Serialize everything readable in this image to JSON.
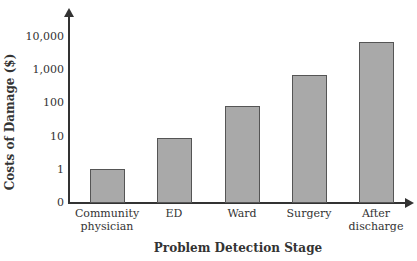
{
  "chart_data": {
    "type": "bar",
    "title": "",
    "xlabel": "Problem Detection Stage",
    "ylabel": "Costs of Damage ($)",
    "yscale": "log",
    "yticks": [
      "0",
      "1",
      "10",
      "100",
      "1,000",
      "10,000"
    ],
    "categories": [
      "Community physician",
      "ED",
      "Ward",
      "Surgery",
      "After discharge"
    ],
    "category_lines": [
      [
        "Community",
        "physician"
      ],
      [
        "ED"
      ],
      [
        "Ward"
      ],
      [
        "Surgery"
      ],
      [
        "After",
        "discharge"
      ]
    ],
    "values": [
      1,
      9,
      80,
      700,
      7000
    ],
    "grid": false,
    "legend": null,
    "bar_color": "#a9a9a9"
  }
}
